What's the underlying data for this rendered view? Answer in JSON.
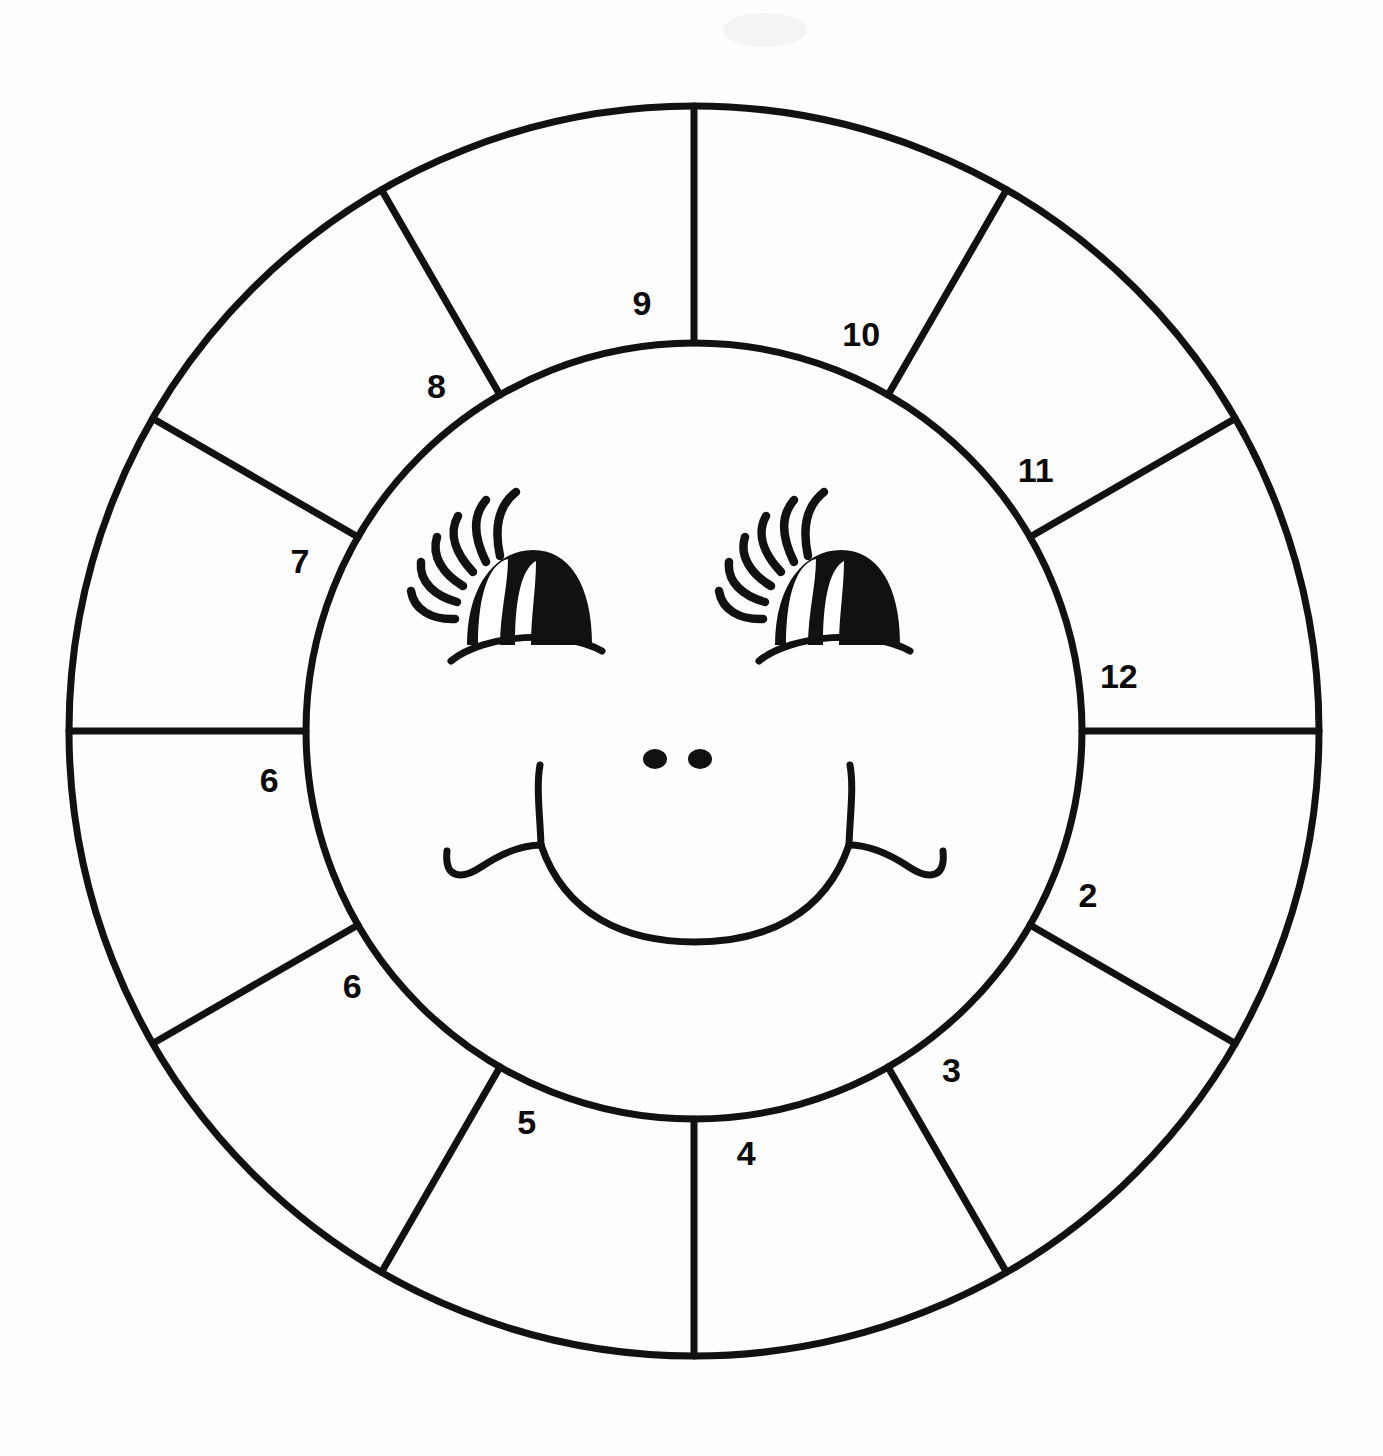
{
  "page": {
    "background_color": "#fdfdfd",
    "ink_color": "#111111",
    "width": 1383,
    "height": 1456
  },
  "wheel": {
    "center_x": 694,
    "center_y": 731,
    "outer_radius": 625,
    "inner_radius": 388,
    "segment_count": 12,
    "stroke_width": 7
  },
  "segments": [
    {
      "label": "9",
      "angle_deg": -90,
      "index": 0
    },
    {
      "label": "10",
      "angle_deg": -60,
      "index": 1
    },
    {
      "label": "11",
      "angle_deg": -30,
      "index": 2
    },
    {
      "label": "12",
      "angle_deg": 0,
      "index": 3
    },
    {
      "label": "2",
      "angle_deg": 30,
      "index": 4
    },
    {
      "label": "3",
      "angle_deg": 60,
      "index": 5
    },
    {
      "label": "4",
      "angle_deg": 90,
      "index": 6
    },
    {
      "label": "5",
      "angle_deg": 120,
      "index": 7
    },
    {
      "label": "6",
      "angle_deg": 150,
      "index": 8
    },
    {
      "label": "6",
      "angle_deg": 180,
      "index": 9
    },
    {
      "label": "7",
      "angle_deg": 210,
      "index": 10
    },
    {
      "label": "8",
      "angle_deg": 240,
      "index": 11
    }
  ],
  "face": {
    "description": "smiling cartoon face with lashed eyes, two nostril dots, wide smile with cheek dimples",
    "left_eye": {
      "cx": 520,
      "cy": 596
    },
    "right_eye": {
      "cx": 828,
      "cy": 596
    },
    "nostrils": [
      {
        "cx": 655,
        "cy": 759
      },
      {
        "cx": 700,
        "cy": 759
      }
    ],
    "mouth": {
      "center_x": 694,
      "bottom_y": 915
    }
  }
}
